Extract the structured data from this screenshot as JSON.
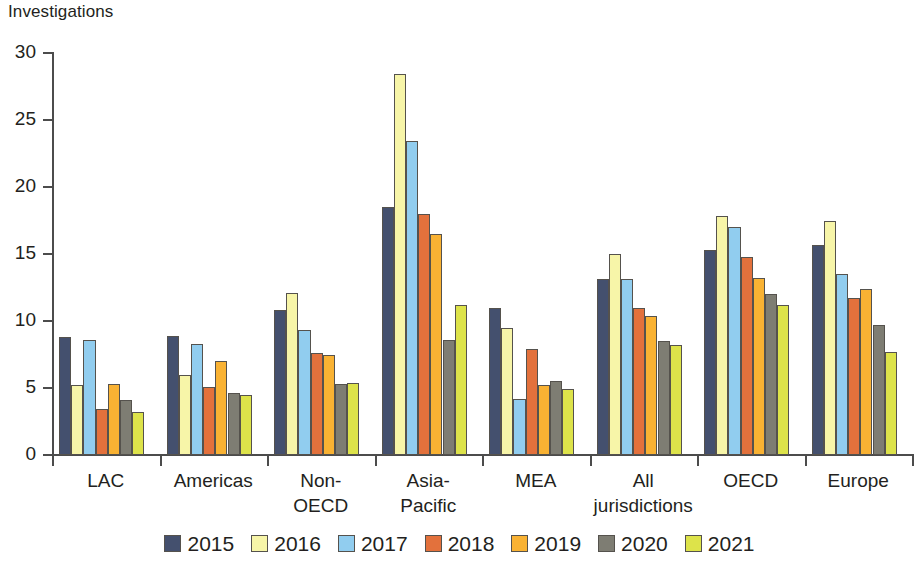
{
  "chart_data": {
    "type": "bar",
    "title": "",
    "subtitle": "",
    "xlabel": "",
    "ylabel": "Investigations",
    "ylim": [
      0,
      30
    ],
    "yticks": [
      0,
      5,
      10,
      15,
      20,
      25,
      30
    ],
    "ytick_labels": [
      "0",
      "5",
      "10",
      "15",
      "20",
      "25",
      "30"
    ],
    "grid": false,
    "legend_position": "bottom",
    "categories": [
      "LAC",
      "Americas",
      "Non-\nOECD",
      "Asia-\nPacific",
      "MEA",
      "All\njurisdictions",
      "OECD",
      "Europe"
    ],
    "category_lines": [
      [
        "LAC"
      ],
      [
        "Americas"
      ],
      [
        "Non-",
        "OECD"
      ],
      [
        "Asia-",
        "Pacific"
      ],
      [
        "MEA"
      ],
      [
        "All",
        "jurisdictions"
      ],
      [
        "OECD"
      ],
      [
        "Europe"
      ]
    ],
    "series": [
      {
        "name": "2015",
        "color": "#44506E",
        "values": [
          8.8,
          8.9,
          10.8,
          18.5,
          11.0,
          13.1,
          15.3,
          15.7
        ]
      },
      {
        "name": "2016",
        "color": "#F7F5A8",
        "values": [
          5.2,
          6.0,
          12.1,
          28.4,
          9.5,
          15.0,
          17.8,
          17.5
        ]
      },
      {
        "name": "2017",
        "color": "#91CDEF",
        "values": [
          8.6,
          8.3,
          9.3,
          23.4,
          4.2,
          13.1,
          17.0,
          13.5
        ]
      },
      {
        "name": "2018",
        "color": "#E3713C",
        "values": [
          3.4,
          5.1,
          7.6,
          18.0,
          7.9,
          11.0,
          14.8,
          11.7
        ]
      },
      {
        "name": "2019",
        "color": "#F9B233",
        "values": [
          5.3,
          7.0,
          7.5,
          16.5,
          5.2,
          10.4,
          13.2,
          12.4
        ]
      },
      {
        "name": "2020",
        "color": "#7E7D73",
        "values": [
          4.1,
          4.6,
          5.3,
          8.6,
          5.5,
          8.5,
          12.0,
          9.7
        ]
      },
      {
        "name": "2021",
        "color": "#DDE34A",
        "values": [
          3.2,
          4.5,
          5.4,
          11.2,
          4.9,
          8.2,
          11.2,
          7.7
        ]
      }
    ]
  },
  "legend": {
    "items": [
      {
        "label": "2015",
        "color": "#44506E"
      },
      {
        "label": "2016",
        "color": "#F7F5A8"
      },
      {
        "label": "2017",
        "color": "#91CDEF"
      },
      {
        "label": "2018",
        "color": "#E3713C"
      },
      {
        "label": "2019",
        "color": "#F9B233"
      },
      {
        "label": "2020",
        "color": "#7E7D73"
      },
      {
        "label": "2021",
        "color": "#DDE34A"
      }
    ]
  },
  "axes": {
    "y_title": "Investigations",
    "axis_color": "#4C4C4C",
    "bar_outline_color": "#55524D"
  }
}
